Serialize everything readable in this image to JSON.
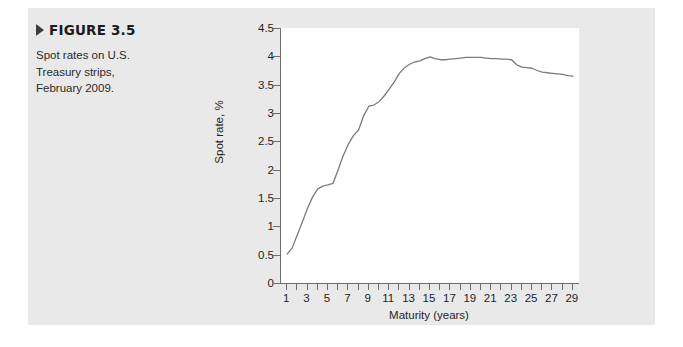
{
  "figure": {
    "label": "FIGURE 3.5",
    "marker_icon": "triangle-right-icon",
    "caption": "Spot rates on U.S. Treasury strips, February 2009."
  },
  "colors": {
    "panel_background": "#e9e9e9",
    "plot_background": "#ffffff",
    "axis": "#6d6d6d",
    "line": "#7b7b7b",
    "text": "#1f1f1f"
  },
  "chart_data": {
    "type": "line",
    "title": "",
    "subtitle": "",
    "xlabel": "Maturity (years)",
    "ylabel": "Spot rate, %",
    "xlim": [
      0.4,
      29.6
    ],
    "ylim": [
      0,
      4.5
    ],
    "grid": false,
    "legend": "none",
    "y_ticks": [
      "0",
      "0.5",
      "1",
      "1.5",
      "2",
      "2.5",
      "3",
      "3.5",
      "4",
      "4.5"
    ],
    "y_tick_values": [
      0,
      0.5,
      1,
      1.5,
      2,
      2.5,
      3,
      3.5,
      4,
      4.5
    ],
    "x_ticks": [
      "1",
      "3",
      "5",
      "7",
      "9",
      "11",
      "13",
      "15",
      "17",
      "19",
      "21",
      "23",
      "25",
      "27",
      "29"
    ],
    "x_tick_values": [
      1,
      3,
      5,
      7,
      9,
      11,
      13,
      15,
      17,
      19,
      21,
      23,
      25,
      27,
      29
    ],
    "x_minor_tick_values": [
      1,
      2,
      3,
      4,
      5,
      6,
      7,
      8,
      9,
      10,
      11,
      12,
      13,
      14,
      15,
      16,
      17,
      18,
      19,
      20,
      21,
      22,
      23,
      24,
      25,
      26,
      27,
      28,
      29
    ],
    "series": [
      {
        "name": "Spot rate",
        "x": [
          1,
          1.5,
          2,
          2.5,
          3,
          3.5,
          4,
          4.5,
          5,
          5.5,
          6,
          6.5,
          7,
          7.5,
          8,
          8.5,
          9,
          9.5,
          10,
          10.5,
          11,
          11.5,
          12,
          12.5,
          13,
          13.5,
          14,
          14.5,
          15,
          15.5,
          16,
          16.5,
          17,
          17.5,
          18,
          18.5,
          19,
          19.5,
          20,
          20.5,
          21,
          21.5,
          22,
          22.5,
          23,
          23.5,
          24,
          24.5,
          25,
          25.5,
          26,
          26.5,
          27,
          27.5,
          28,
          28.5,
          29
        ],
        "values": [
          0.51,
          0.62,
          0.85,
          1.08,
          1.32,
          1.52,
          1.66,
          1.71,
          1.73,
          1.76,
          2.0,
          2.25,
          2.45,
          2.6,
          2.7,
          2.95,
          3.12,
          3.14,
          3.2,
          3.3,
          3.42,
          3.55,
          3.7,
          3.8,
          3.86,
          3.9,
          3.92,
          3.96,
          3.99,
          3.96,
          3.94,
          3.94,
          3.95,
          3.96,
          3.97,
          3.98,
          3.98,
          3.98,
          3.98,
          3.97,
          3.96,
          3.96,
          3.95,
          3.95,
          3.94,
          3.85,
          3.81,
          3.8,
          3.79,
          3.75,
          3.72,
          3.71,
          3.7,
          3.69,
          3.68,
          3.66,
          3.65
        ]
      }
    ]
  }
}
